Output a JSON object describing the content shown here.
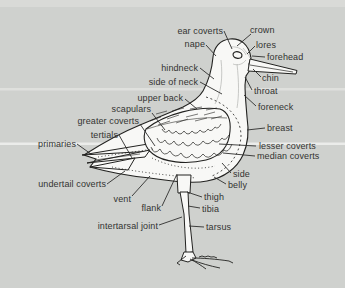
{
  "diagram": {
    "colors": {
      "background": "#cfd1ce",
      "ink": "#222220",
      "bird_fill": "#f8f8f6",
      "label_text": "#333331"
    },
    "labels": [
      {
        "text": "ear coverts"
      },
      {
        "text": "crown"
      },
      {
        "text": "nape"
      },
      {
        "text": "lores"
      },
      {
        "text": "forehead"
      },
      {
        "text": "hindneck"
      },
      {
        "text": "chin"
      },
      {
        "text": "side of neck"
      },
      {
        "text": "throat"
      },
      {
        "text": "upper back"
      },
      {
        "text": "foreneck"
      },
      {
        "text": "scapulars"
      },
      {
        "text": "greater coverts"
      },
      {
        "text": "breast"
      },
      {
        "text": "tertials"
      },
      {
        "text": "primaries"
      },
      {
        "text": "lesser coverts"
      },
      {
        "text": "median coverts"
      },
      {
        "text": "side"
      },
      {
        "text": "undertail coverts"
      },
      {
        "text": "belly"
      },
      {
        "text": "vent"
      },
      {
        "text": "thigh"
      },
      {
        "text": "flank"
      },
      {
        "text": "tibia"
      },
      {
        "text": "intertarsal joint"
      },
      {
        "text": "tarsus"
      }
    ]
  }
}
